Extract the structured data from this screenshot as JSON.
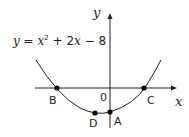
{
  "diagram": {
    "equation": {
      "lhs": "y",
      "eq": " = ",
      "x": "x",
      "exp": "2",
      "rest": " + 2",
      "x2": "x",
      "tail": " − 8"
    },
    "axes": {
      "x_label": "x",
      "y_label": "y",
      "origin_label": "0"
    },
    "points": [
      {
        "label": "A",
        "desc": "y-intercept",
        "value": "(0, -8)"
      },
      {
        "label": "B",
        "desc": "root",
        "value": "(-4, 0)"
      },
      {
        "label": "C",
        "desc": "root",
        "value": "(2, 0)"
      },
      {
        "label": "D",
        "desc": "vertex",
        "value": "(-1, -9)"
      }
    ],
    "colors": {
      "ink": "#231f20"
    }
  }
}
